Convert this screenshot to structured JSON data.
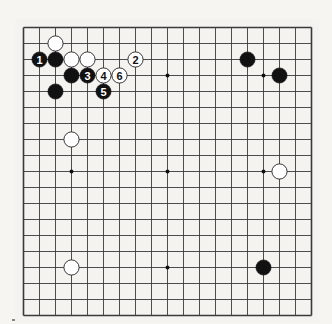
{
  "diagram": {
    "type": "go-board",
    "size": 19,
    "colors": {
      "background": "#f6f5f1",
      "board": "#f4f3ef",
      "line": "#3a3a3a",
      "black_stone": "#111111",
      "white_stone": "#ffffff",
      "white_stroke": "#222222"
    },
    "star_points": [
      [
        3,
        3
      ],
      [
        9,
        3
      ],
      [
        15,
        3
      ],
      [
        3,
        9
      ],
      [
        9,
        9
      ],
      [
        15,
        9
      ],
      [
        3,
        15
      ],
      [
        9,
        15
      ],
      [
        15,
        15
      ]
    ],
    "stones": [
      {
        "color": "white",
        "col": 2,
        "row": 1,
        "label": ""
      },
      {
        "color": "black",
        "col": 1,
        "row": 2,
        "label": "1"
      },
      {
        "color": "black",
        "col": 2,
        "row": 2,
        "label": ""
      },
      {
        "color": "white",
        "col": 3,
        "row": 2,
        "label": ""
      },
      {
        "color": "white",
        "col": 4,
        "row": 2,
        "label": ""
      },
      {
        "color": "white",
        "col": 7,
        "row": 2,
        "label": "2"
      },
      {
        "color": "black",
        "col": 3,
        "row": 3,
        "label": ""
      },
      {
        "color": "black",
        "col": 4,
        "row": 3,
        "label": "3"
      },
      {
        "color": "white",
        "col": 5,
        "row": 3,
        "label": "4"
      },
      {
        "color": "white",
        "col": 6,
        "row": 3,
        "label": "6"
      },
      {
        "color": "black",
        "col": 5,
        "row": 4,
        "label": "5"
      },
      {
        "color": "black",
        "col": 2,
        "row": 4,
        "label": ""
      },
      {
        "color": "black",
        "col": 14,
        "row": 2,
        "label": ""
      },
      {
        "color": "black",
        "col": 16,
        "row": 3,
        "label": ""
      },
      {
        "color": "white",
        "col": 3,
        "row": 7,
        "label": ""
      },
      {
        "color": "white",
        "col": 16,
        "row": 9,
        "label": ""
      },
      {
        "color": "white",
        "col": 3,
        "row": 15,
        "label": ""
      },
      {
        "color": "black",
        "col": 15,
        "row": 15,
        "label": ""
      }
    ],
    "move_sequence": [
      "1",
      "2",
      "3",
      "4",
      "5",
      "6"
    ]
  }
}
